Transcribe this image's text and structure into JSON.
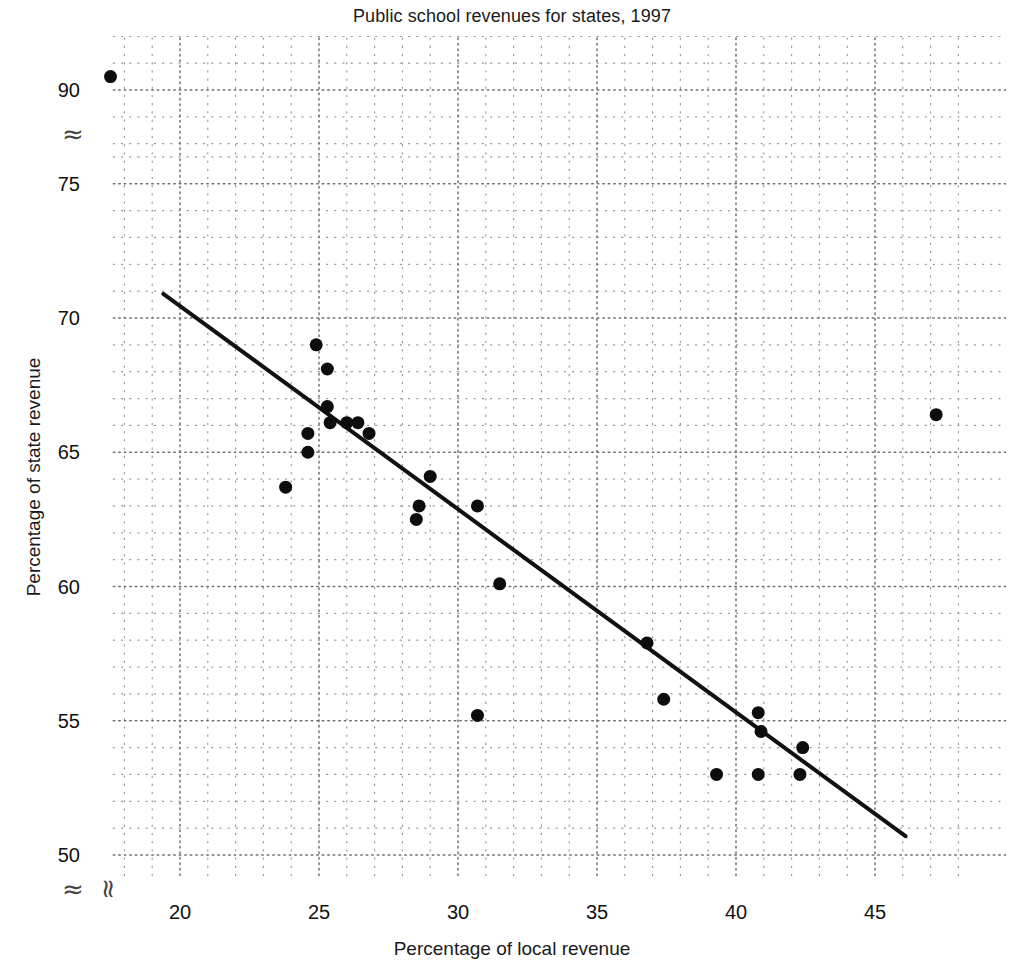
{
  "chart_data": {
    "type": "scatter",
    "title": "Public school revenues for states, 1997",
    "xlabel": "Percentage of local revenue",
    "ylabel": "Percentage of state revenue",
    "xlim": [
      17,
      48
    ],
    "ylim_lower": [
      49,
      76
    ],
    "ylim_upper": [
      88,
      92
    ],
    "axis_break": {
      "y_between": [
        76,
        88
      ],
      "x_at": 18.6,
      "symbol": "≈"
    },
    "grid": "minor dotted grid, major dotted gridlines every 5 units on x and 1 unit on y",
    "xticks": [
      20,
      25,
      30,
      35,
      40,
      45
    ],
    "yticks": [
      50,
      55,
      60,
      65,
      70,
      75,
      90
    ],
    "legend": "none",
    "marker": {
      "shape": "circle",
      "color": "#0d0d0d",
      "size_px": 13
    },
    "trendline": {
      "present": true,
      "color": "#111111",
      "width_px": 4,
      "x": [
        19.4,
        46.1
      ],
      "y": [
        70.9,
        50.7
      ],
      "slope": -0.757,
      "intercept": 85.6
    },
    "points": [
      {
        "x": 17.5,
        "y": 90.5
      },
      {
        "x": 23.8,
        "y": 63.7
      },
      {
        "x": 24.6,
        "y": 65.7
      },
      {
        "x": 24.6,
        "y": 65.0
      },
      {
        "x": 24.9,
        "y": 69.0
      },
      {
        "x": 25.3,
        "y": 68.1
      },
      {
        "x": 25.3,
        "y": 66.7
      },
      {
        "x": 25.4,
        "y": 66.1
      },
      {
        "x": 26.0,
        "y": 66.1
      },
      {
        "x": 26.4,
        "y": 66.1
      },
      {
        "x": 26.8,
        "y": 65.7
      },
      {
        "x": 28.5,
        "y": 62.5
      },
      {
        "x": 28.6,
        "y": 63.0
      },
      {
        "x": 29.0,
        "y": 64.1
      },
      {
        "x": 30.7,
        "y": 63.0
      },
      {
        "x": 30.7,
        "y": 55.2
      },
      {
        "x": 31.5,
        "y": 60.1
      },
      {
        "x": 36.8,
        "y": 57.9
      },
      {
        "x": 37.4,
        "y": 55.8
      },
      {
        "x": 39.3,
        "y": 53.0
      },
      {
        "x": 40.8,
        "y": 55.3
      },
      {
        "x": 40.9,
        "y": 54.6
      },
      {
        "x": 40.8,
        "y": 53.0
      },
      {
        "x": 42.3,
        "y": 53.0
      },
      {
        "x": 42.4,
        "y": 54.0
      },
      {
        "x": 47.2,
        "y": 66.4
      }
    ],
    "n_points": 26
  },
  "ticklabels": {
    "y": [
      "90",
      "75",
      "70",
      "65",
      "60",
      "55",
      "50"
    ],
    "x": [
      "20",
      "25",
      "30",
      "35",
      "40",
      "45"
    ]
  },
  "symbols": {
    "break_y_top": "≈",
    "break_y_bottom": "≈",
    "break_x": "≈"
  }
}
